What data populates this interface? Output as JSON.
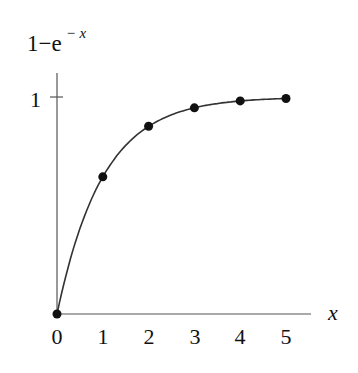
{
  "chart_data": {
    "type": "line",
    "title": "",
    "ylabel": "1−e",
    "ylabel_exponent": "− x",
    "xlabel": "x",
    "x": [
      0,
      1,
      2,
      3,
      4,
      5
    ],
    "series": [
      {
        "name": "1−e^(−x)",
        "values": [
          0,
          0.632,
          0.865,
          0.95,
          0.982,
          0.993
        ],
        "markers": true,
        "smooth_curve": true
      }
    ],
    "x_ticks": [
      "0",
      "1",
      "2",
      "3",
      "4",
      "5"
    ],
    "y_ticks": [
      "1"
    ],
    "xlim": [
      0,
      5.5
    ],
    "ylim": [
      0,
      1.1
    ],
    "grid": false,
    "legend": null
  },
  "colors": {
    "line": "#333333",
    "marker": "#111111",
    "axis": "#555555"
  }
}
